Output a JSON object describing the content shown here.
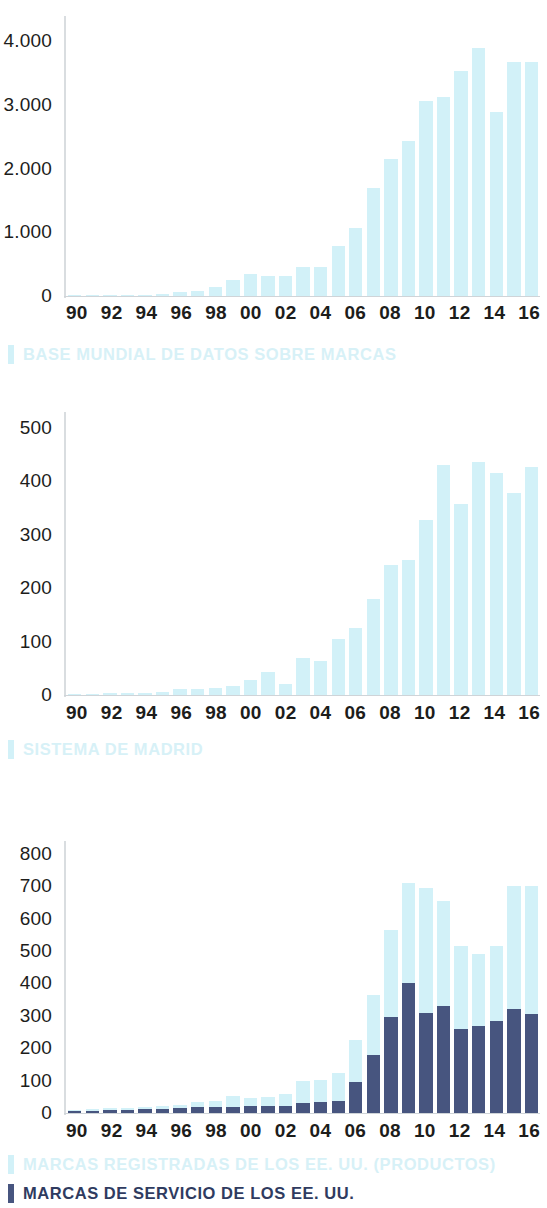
{
  "charts": [
    {
      "id": "base-mundial",
      "type": "bar",
      "title": "",
      "xlabel": "",
      "ylabel": "",
      "ylim": [
        0,
        4400
      ],
      "yticks": [
        0,
        1000,
        2000,
        3000,
        4000
      ],
      "ytick_labels": [
        "0",
        "1.000",
        "2.000",
        "3.000",
        "4.000"
      ],
      "grid": false,
      "legend_position": "below",
      "categories": [
        "90",
        "91",
        "92",
        "93",
        "94",
        "95",
        "96",
        "97",
        "98",
        "99",
        "00",
        "01",
        "02",
        "03",
        "04",
        "05",
        "06",
        "07",
        "08",
        "09",
        "10",
        "11",
        "12",
        "13",
        "14",
        "15",
        "16"
      ],
      "xtick_labels": [
        "90",
        "",
        "92",
        "",
        "94",
        "",
        "96",
        "",
        "98",
        "",
        "00",
        "",
        "02",
        "",
        "04",
        "",
        "06",
        "",
        "08",
        "",
        "10",
        "",
        "12",
        "",
        "14",
        "",
        "16"
      ],
      "series": [
        {
          "name": "BASE MUNDIAL DE DATOS SOBRE MARCAS",
          "color": "#d2f1f8",
          "values": [
            10,
            12,
            15,
            18,
            22,
            28,
            60,
            75,
            140,
            250,
            350,
            310,
            310,
            450,
            450,
            790,
            1070,
            1690,
            2160,
            2440,
            3060,
            3120,
            3530,
            3900,
            2890,
            3680,
            3680
          ]
        }
      ],
      "legend": [
        {
          "label": "BASE MUNDIAL DE DATOS SOBRE MARCAS",
          "color": "#d2f1f8"
        }
      ]
    },
    {
      "id": "sistema-madrid",
      "type": "bar",
      "title": "",
      "xlabel": "",
      "ylabel": "",
      "ylim": [
        0,
        530
      ],
      "yticks": [
        0,
        100,
        200,
        300,
        400,
        500
      ],
      "ytick_labels": [
        "0",
        "100",
        "200",
        "300",
        "400",
        "500"
      ],
      "grid": false,
      "legend_position": "below",
      "categories": [
        "90",
        "91",
        "92",
        "93",
        "94",
        "95",
        "96",
        "97",
        "98",
        "99",
        "00",
        "01",
        "02",
        "03",
        "04",
        "05",
        "06",
        "07",
        "08",
        "09",
        "10",
        "11",
        "12",
        "13",
        "14",
        "15",
        "16"
      ],
      "xtick_labels": [
        "90",
        "",
        "92",
        "",
        "94",
        "",
        "96",
        "",
        "98",
        "",
        "00",
        "",
        "02",
        "",
        "04",
        "",
        "06",
        "",
        "08",
        "",
        "10",
        "",
        "12",
        "",
        "14",
        "",
        "16"
      ],
      "series": [
        {
          "name": "SISTEMA DE MADRID",
          "color": "#d2f1f8",
          "values": [
            2,
            2,
            3,
            3,
            4,
            5,
            12,
            12,
            14,
            16,
            28,
            43,
            20,
            70,
            64,
            104,
            126,
            180,
            243,
            253,
            327,
            430,
            357,
            436,
            416,
            379,
            427
          ]
        }
      ],
      "legend": [
        {
          "label": "SISTEMA DE MADRID",
          "color": "#d2f1f8"
        }
      ]
    },
    {
      "id": "marcas-ee-uu",
      "type": "bar",
      "title": "",
      "xlabel": "",
      "ylabel": "",
      "ylim": [
        0,
        840
      ],
      "yticks": [
        0,
        100,
        200,
        300,
        400,
        500,
        600,
        700,
        800
      ],
      "ytick_labels": [
        "0",
        "100",
        "200",
        "300",
        "400",
        "500",
        "600",
        "700",
        "800"
      ],
      "grid": false,
      "stacked": true,
      "legend_position": "below",
      "categories": [
        "90",
        "91",
        "92",
        "93",
        "94",
        "95",
        "96",
        "97",
        "98",
        "99",
        "00",
        "01",
        "02",
        "03",
        "04",
        "05",
        "06",
        "07",
        "08",
        "09",
        "10",
        "11",
        "12",
        "13",
        "14",
        "15",
        "16"
      ],
      "xtick_labels": [
        "90",
        "",
        "92",
        "",
        "94",
        "",
        "96",
        "",
        "98",
        "",
        "00",
        "",
        "02",
        "",
        "04",
        "",
        "06",
        "",
        "08",
        "",
        "10",
        "",
        "12",
        "",
        "14",
        "",
        "16"
      ],
      "series": [
        {
          "name": "MARCAS DE SERVICIO DE LOS EE. UU.",
          "color": "#47557f",
          "values": [
            6,
            7,
            9,
            10,
            11,
            12,
            14,
            18,
            18,
            20,
            22,
            22,
            22,
            32,
            35,
            38,
            96,
            180,
            295,
            400,
            310,
            330,
            258,
            270,
            285,
            322,
            307
          ]
        },
        {
          "name": "MARCAS REGISTRADAS DE LOS EE. UU. (PRODUCTOS)",
          "color": "#d2f1f8",
          "values": [
            3,
            4,
            6,
            7,
            8,
            9,
            12,
            16,
            20,
            34,
            25,
            26,
            36,
            66,
            67,
            86,
            130,
            185,
            270,
            310,
            385,
            325,
            258,
            222,
            230,
            378,
            393
          ]
        }
      ],
      "legend": [
        {
          "label": "MARCAS REGISTRADAS DE LOS EE. UU. (PRODUCTOS)",
          "color": "#d2f1f8"
        },
        {
          "label": "MARCAS DE SERVICIO DE LOS EE. UU.",
          "color": "#47557f"
        }
      ]
    }
  ],
  "chart_data": [
    {
      "type": "bar",
      "title": "BASE MUNDIAL DE DATOS SOBRE MARCAS",
      "xlabel": "",
      "ylabel": "",
      "ylim": [
        0,
        4400
      ],
      "categories": [
        "90",
        "91",
        "92",
        "93",
        "94",
        "95",
        "96",
        "97",
        "98",
        "99",
        "00",
        "01",
        "02",
        "03",
        "04",
        "05",
        "06",
        "07",
        "08",
        "09",
        "10",
        "11",
        "12",
        "13",
        "14",
        "15",
        "16"
      ],
      "values": [
        10,
        12,
        15,
        18,
        22,
        28,
        60,
        75,
        140,
        250,
        350,
        310,
        310,
        450,
        450,
        790,
        1070,
        1690,
        2160,
        2440,
        3060,
        3120,
        3530,
        3900,
        2890,
        3680,
        3680
      ],
      "legend": [
        "BASE MUNDIAL DE DATOS SOBRE MARCAS"
      ],
      "grid": false
    },
    {
      "type": "bar",
      "title": "SISTEMA DE MADRID",
      "xlabel": "",
      "ylabel": "",
      "ylim": [
        0,
        530
      ],
      "categories": [
        "90",
        "91",
        "92",
        "93",
        "94",
        "95",
        "96",
        "97",
        "98",
        "99",
        "00",
        "01",
        "02",
        "03",
        "04",
        "05",
        "06",
        "07",
        "08",
        "09",
        "10",
        "11",
        "12",
        "13",
        "14",
        "15",
        "16"
      ],
      "values": [
        2,
        2,
        3,
        3,
        4,
        5,
        12,
        12,
        14,
        16,
        28,
        43,
        20,
        70,
        64,
        104,
        126,
        180,
        243,
        253,
        327,
        430,
        357,
        436,
        416,
        379,
        427
      ],
      "legend": [
        "SISTEMA DE MADRID"
      ],
      "grid": false
    },
    {
      "type": "bar",
      "stacked": true,
      "title": "MARCAS DE LOS EE. UU.",
      "xlabel": "",
      "ylabel": "",
      "ylim": [
        0,
        840
      ],
      "categories": [
        "90",
        "91",
        "92",
        "93",
        "94",
        "95",
        "96",
        "97",
        "98",
        "99",
        "00",
        "01",
        "02",
        "03",
        "04",
        "05",
        "06",
        "07",
        "08",
        "09",
        "10",
        "11",
        "12",
        "13",
        "14",
        "15",
        "16"
      ],
      "series": [
        {
          "name": "MARCAS DE SERVICIO DE LOS EE. UU.",
          "values": [
            6,
            7,
            9,
            10,
            11,
            12,
            14,
            18,
            18,
            20,
            22,
            22,
            22,
            32,
            35,
            38,
            96,
            180,
            295,
            400,
            310,
            330,
            258,
            270,
            285,
            322,
            307
          ]
        },
        {
          "name": "MARCAS REGISTRADAS DE LOS EE. UU. (PRODUCTOS)",
          "values": [
            3,
            4,
            6,
            7,
            8,
            9,
            12,
            16,
            20,
            34,
            25,
            26,
            36,
            66,
            67,
            86,
            130,
            185,
            270,
            310,
            385,
            325,
            258,
            222,
            230,
            378,
            393
          ]
        }
      ],
      "legend": [
        "MARCAS REGISTRADAS DE LOS EE. UU. (PRODUCTOS)",
        "MARCAS DE SERVICIO DE LOS EE. UU."
      ],
      "grid": false
    }
  ],
  "colors": {
    "light_blue": "#d2f1f8",
    "dark_blue": "#47557f",
    "axis": "#d9dde0",
    "text": "#1d1d1b"
  }
}
